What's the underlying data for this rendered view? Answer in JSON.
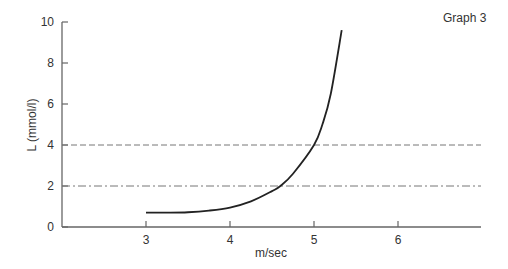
{
  "chart_data": {
    "type": "line",
    "title": "Graph 3",
    "xlabel": "m/sec",
    "ylabel": "L (mmol/l)",
    "xlim": [
      2,
      7
    ],
    "ylim": [
      0,
      10
    ],
    "x_ticks": [
      "3",
      "4",
      "5",
      "6"
    ],
    "y_ticks": [
      "0",
      "2",
      "4",
      "6",
      "8",
      "10"
    ],
    "grid": false,
    "series": [
      {
        "name": "Lactate curve",
        "style": "solid",
        "x": [
          3.0,
          3.25,
          3.5,
          3.75,
          4.0,
          4.25,
          4.5,
          4.6,
          4.75,
          5.0,
          5.1,
          5.2,
          5.33
        ],
        "y": [
          0.7,
          0.7,
          0.72,
          0.8,
          0.95,
          1.25,
          1.75,
          2.0,
          2.6,
          4.0,
          5.0,
          6.5,
          9.6
        ]
      }
    ],
    "reference_lines": [
      {
        "name": "4 mmol/l threshold",
        "y": 4,
        "style": "dashed"
      },
      {
        "name": "2 mmol/l threshold",
        "y": 2,
        "style": "dash-dot"
      }
    ]
  }
}
